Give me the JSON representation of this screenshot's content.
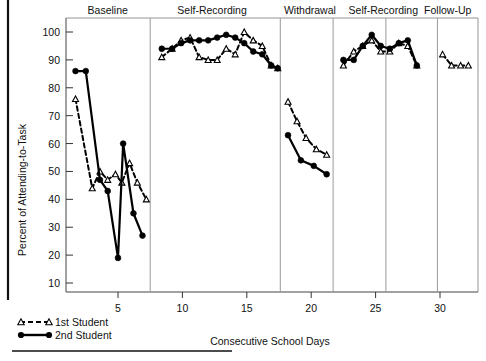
{
  "chart_data": {
    "type": "line",
    "title": "",
    "xlabel": "Consecutive School Days",
    "ylabel": "Percent of Attending-to-Task",
    "xlim": [
      0,
      33
    ],
    "ylim": [
      0,
      105
    ],
    "xticks": [
      5,
      10,
      15,
      20,
      25,
      30
    ],
    "yticks": [
      10,
      20,
      30,
      40,
      50,
      60,
      70,
      80,
      90,
      100
    ],
    "grid": false,
    "legend_position": "bottom-left",
    "phases": [
      {
        "name": "Baseline",
        "start": 1,
        "end": 7,
        "label_x": 4.2
      },
      {
        "name": "Self-Recording",
        "start": 8,
        "end": 17,
        "label_x": 12.3
      },
      {
        "name": "Withdrawal",
        "start": 18,
        "end": 22,
        "label_x": 19.9
      },
      {
        "name": "Self-Recording",
        "start": 23,
        "end": 28,
        "label_x": 25.6
      },
      {
        "name": "Follow-Up",
        "start": 29,
        "end": 32,
        "label_x": 30.6
      }
    ],
    "phase_dividers": [
      7.5,
      17.6,
      21.7,
      25.8,
      29.8
    ],
    "series": [
      {
        "name": "1st Student",
        "style": "dashed",
        "marker": "open-triangle",
        "color": "#000000",
        "segments": [
          {
            "phase": "Baseline",
            "points": [
              {
                "x": 1.7,
                "y": 76
              },
              {
                "x": 3.0,
                "y": 44
              },
              {
                "x": 3.6,
                "y": 50
              },
              {
                "x": 4.2,
                "y": 47
              },
              {
                "x": 4.8,
                "y": 49
              },
              {
                "x": 5.3,
                "y": 46
              },
              {
                "x": 5.9,
                "y": 53
              },
              {
                "x": 6.5,
                "y": 46
              },
              {
                "x": 7.2,
                "y": 40
              }
            ]
          },
          {
            "phase": "Self-Recording",
            "points": [
              {
                "x": 8.4,
                "y": 91
              },
              {
                "x": 9.2,
                "y": 94
              },
              {
                "x": 9.9,
                "y": 97
              },
              {
                "x": 10.6,
                "y": 98
              },
              {
                "x": 11.3,
                "y": 91
              },
              {
                "x": 12.0,
                "y": 90
              },
              {
                "x": 12.7,
                "y": 90
              },
              {
                "x": 13.4,
                "y": 94
              },
              {
                "x": 14.1,
                "y": 92
              },
              {
                "x": 14.8,
                "y": 100
              },
              {
                "x": 15.5,
                "y": 97
              },
              {
                "x": 16.2,
                "y": 95
              },
              {
                "x": 16.9,
                "y": 88
              },
              {
                "x": 17.4,
                "y": 87
              }
            ]
          },
          {
            "phase": "Withdrawal",
            "points": [
              {
                "x": 18.2,
                "y": 75
              },
              {
                "x": 18.9,
                "y": 68
              },
              {
                "x": 19.6,
                "y": 62
              },
              {
                "x": 20.4,
                "y": 58
              },
              {
                "x": 21.2,
                "y": 56
              }
            ]
          },
          {
            "phase": "Self-Recording",
            "points": [
              {
                "x": 22.5,
                "y": 88
              },
              {
                "x": 23.3,
                "y": 93
              },
              {
                "x": 24.0,
                "y": 95
              },
              {
                "x": 24.7,
                "y": 97
              },
              {
                "x": 25.4,
                "y": 93
              },
              {
                "x": 26.1,
                "y": 93
              },
              {
                "x": 26.8,
                "y": 96
              },
              {
                "x": 27.5,
                "y": 95
              },
              {
                "x": 28.2,
                "y": 88
              }
            ]
          },
          {
            "phase": "Follow-Up",
            "points": [
              {
                "x": 30.2,
                "y": 92
              },
              {
                "x": 30.9,
                "y": 88
              },
              {
                "x": 31.6,
                "y": 88
              },
              {
                "x": 32.2,
                "y": 88
              }
            ]
          }
        ]
      },
      {
        "name": "2nd Student",
        "style": "solid",
        "marker": "filled-circle",
        "color": "#000000",
        "segments": [
          {
            "phase": "Baseline",
            "points": [
              {
                "x": 1.7,
                "y": 86
              },
              {
                "x": 2.5,
                "y": 86
              },
              {
                "x": 3.6,
                "y": 47
              },
              {
                "x": 4.2,
                "y": 43
              },
              {
                "x": 5.0,
                "y": 19
              },
              {
                "x": 5.4,
                "y": 60
              },
              {
                "x": 6.2,
                "y": 35
              },
              {
                "x": 6.9,
                "y": 27
              }
            ]
          },
          {
            "phase": "Self-Recording",
            "points": [
              {
                "x": 8.4,
                "y": 94
              },
              {
                "x": 9.2,
                "y": 94
              },
              {
                "x": 9.9,
                "y": 96
              },
              {
                "x": 10.6,
                "y": 97
              },
              {
                "x": 11.3,
                "y": 97
              },
              {
                "x": 12.0,
                "y": 97
              },
              {
                "x": 12.7,
                "y": 98
              },
              {
                "x": 13.4,
                "y": 99
              },
              {
                "x": 14.1,
                "y": 98
              },
              {
                "x": 14.8,
                "y": 96
              },
              {
                "x": 15.5,
                "y": 93
              },
              {
                "x": 16.2,
                "y": 92
              },
              {
                "x": 16.9,
                "y": 88
              },
              {
                "x": 17.4,
                "y": 87
              }
            ]
          },
          {
            "phase": "Withdrawal",
            "points": [
              {
                "x": 18.2,
                "y": 63
              },
              {
                "x": 19.2,
                "y": 54
              },
              {
                "x": 20.2,
                "y": 52
              },
              {
                "x": 21.2,
                "y": 49
              }
            ]
          },
          {
            "phase": "Self-Recording",
            "points": [
              {
                "x": 22.5,
                "y": 90
              },
              {
                "x": 23.3,
                "y": 90
              },
              {
                "x": 24.0,
                "y": 95
              },
              {
                "x": 24.7,
                "y": 99
              },
              {
                "x": 25.4,
                "y": 95
              },
              {
                "x": 26.1,
                "y": 94
              },
              {
                "x": 26.8,
                "y": 96
              },
              {
                "x": 27.5,
                "y": 97
              },
              {
                "x": 28.2,
                "y": 88
              }
            ]
          }
        ]
      }
    ],
    "legend": [
      {
        "label": "1st Student",
        "style": "dashed",
        "marker": "open-triangle"
      },
      {
        "label": "2nd Student",
        "style": "solid",
        "marker": "filled-circle"
      }
    ]
  }
}
